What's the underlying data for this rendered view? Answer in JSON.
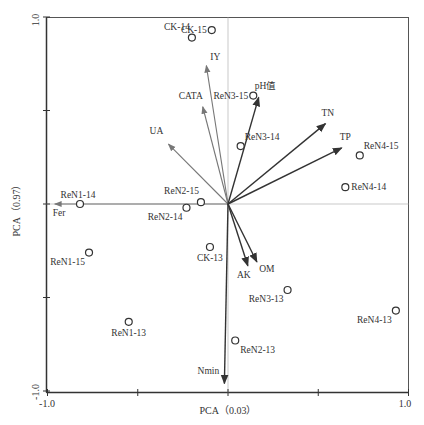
{
  "chart_data": {
    "type": "scatter",
    "subtype": "pca-biplot",
    "title": "",
    "xlabel": "PCA（0.03）",
    "ylabel": "PCA（0.97）",
    "xlim": [
      -1.0,
      1.0
    ],
    "ylim": [
      -1.0,
      1.0
    ],
    "x_ticks": [
      -1.0,
      -0.5,
      0,
      0.5,
      1.0
    ],
    "y_ticks": [
      -1.0,
      -0.5,
      0,
      0.5,
      1.0
    ],
    "x_tick_labels": [
      "-1.0",
      "1.0"
    ],
    "y_tick_labels": [
      "-1.0",
      "1.0"
    ],
    "grid": false,
    "reference_lines": {
      "x0": true,
      "y0": true
    },
    "legend": null,
    "samples": [
      {
        "name": "CK-15",
        "x": -0.09,
        "y": 0.93,
        "label_side": "left"
      },
      {
        "name": "CK-14",
        "x": -0.2,
        "y": 0.89,
        "label_side": "top-left"
      },
      {
        "name": "CK-13",
        "x": -0.1,
        "y": -0.23,
        "label_side": "bottom"
      },
      {
        "name": "ReN1-14",
        "x": -0.82,
        "y": 0.0,
        "label_side": "top"
      },
      {
        "name": "ReN1-15",
        "x": -0.77,
        "y": -0.26,
        "label_side": "bottom-left"
      },
      {
        "name": "ReN1-13",
        "x": -0.55,
        "y": -0.63,
        "label_side": "bottom"
      },
      {
        "name": "ReN2-15",
        "x": -0.15,
        "y": 0.01,
        "label_side": "top-left"
      },
      {
        "name": "ReN2-14",
        "x": -0.23,
        "y": -0.02,
        "label_side": "bottom-left"
      },
      {
        "name": "ReN2-13",
        "x": 0.04,
        "y": -0.73,
        "label_side": "bottom-right"
      },
      {
        "name": "ReN3-15",
        "x": 0.14,
        "y": 0.58,
        "label_side": "left"
      },
      {
        "name": "ReN3-14",
        "x": 0.07,
        "y": 0.31,
        "label_side": "top-right"
      },
      {
        "name": "ReN3-13",
        "x": 0.33,
        "y": -0.46,
        "label_side": "bottom-left"
      },
      {
        "name": "ReN4-15",
        "x": 0.73,
        "y": 0.26,
        "label_side": "top-right"
      },
      {
        "name": "ReN4-14",
        "x": 0.65,
        "y": 0.09,
        "label_side": "right"
      },
      {
        "name": "ReN4-13",
        "x": 0.93,
        "y": -0.57,
        "label_side": "bottom-left"
      }
    ],
    "variables": [
      {
        "name": "IY",
        "x": -0.12,
        "y": 0.74,
        "color": "#777777"
      },
      {
        "name": "CATA",
        "x": -0.14,
        "y": 0.52,
        "color": "#777777"
      },
      {
        "name": "UA",
        "x": -0.33,
        "y": 0.32,
        "color": "#777777"
      },
      {
        "name": "Fer",
        "x": -0.96,
        "y": 0.0,
        "color": "#777777"
      },
      {
        "name": "pH值",
        "x": 0.17,
        "y": 0.57,
        "color": "#333333"
      },
      {
        "name": "TN",
        "x": 0.54,
        "y": 0.43,
        "color": "#333333"
      },
      {
        "name": "TP",
        "x": 0.63,
        "y": 0.3,
        "color": "#333333"
      },
      {
        "name": "AK",
        "x": 0.11,
        "y": -0.33,
        "color": "#333333"
      },
      {
        "name": "OM",
        "x": 0.16,
        "y": -0.31,
        "color": "#333333"
      },
      {
        "name": "Nmin",
        "x": -0.02,
        "y": -0.96,
        "color": "#333333"
      }
    ]
  },
  "labels": {
    "xlabel": "PCA（0.03）",
    "ylabel": "PCA（0.97）",
    "x_min": "-1.0",
    "x_max": "1.0",
    "y_min": "-1.0",
    "y_max": "1.0"
  }
}
